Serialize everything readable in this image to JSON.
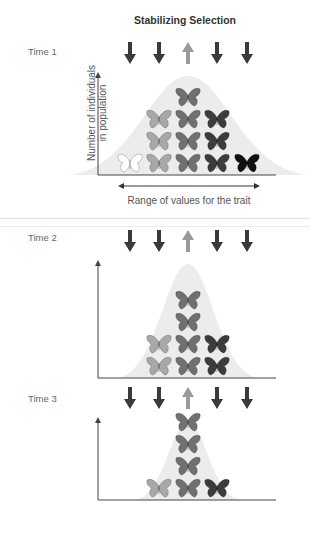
{
  "title": "Stabilizing Selection",
  "labels": {
    "y_axis": [
      "Number of individuals",
      "in population"
    ],
    "x_axis": "Range of values for the trait"
  },
  "colors": {
    "down_arrow": "#3a3a3a",
    "up_arrow": "#9a9a9a",
    "axis": "#444444",
    "bell": "#ececec",
    "phenotypes": [
      "#ffffff",
      "#a8a8a8",
      "#707070",
      "#3c3c3c",
      "#111111"
    ]
  },
  "arrows": [
    "down",
    "down",
    "up",
    "down",
    "down"
  ],
  "panels": [
    {
      "label": "Time 1",
      "counts": [
        1,
        3,
        4,
        3,
        1
      ]
    },
    {
      "label": "Time 2",
      "counts": [
        0,
        2,
        4,
        2,
        0
      ]
    },
    {
      "label": "Time 3",
      "counts": [
        0,
        1,
        4,
        1,
        0
      ]
    }
  ],
  "chart_data": {
    "type": "bar",
    "title": "Stabilizing Selection",
    "xlabel": "Range of values for the trait",
    "ylabel": "Number of individuals in population",
    "categories": [
      "phenotype 1 (lightest)",
      "phenotype 2",
      "phenotype 3 (intermediate)",
      "phenotype 4",
      "phenotype 5 (darkest)"
    ],
    "selection": [
      "against",
      "against",
      "favored",
      "against",
      "against"
    ],
    "series": [
      {
        "name": "Time 1",
        "values": [
          1,
          3,
          4,
          3,
          1
        ]
      },
      {
        "name": "Time 2",
        "values": [
          0,
          2,
          4,
          2,
          0
        ]
      },
      {
        "name": "Time 3",
        "values": [
          0,
          1,
          4,
          1,
          0
        ]
      }
    ]
  }
}
